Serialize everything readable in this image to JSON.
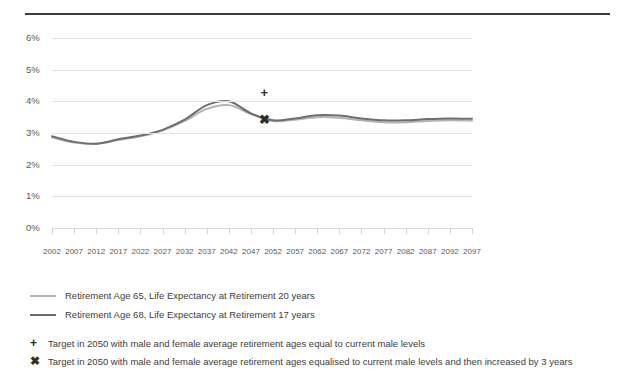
{
  "chart_data": {
    "type": "line",
    "title": "",
    "xlabel": "",
    "ylabel": "",
    "ylim": [
      0,
      6
    ],
    "xlim": [
      2002,
      2097
    ],
    "grid": true,
    "legend_position": "below-chart",
    "ytick_labels": [
      "0%",
      "1%",
      "2%",
      "3%",
      "4%",
      "5%",
      "6%"
    ],
    "ytick_values": [
      0,
      1,
      2,
      3,
      4,
      5,
      6
    ],
    "categories": [
      2002,
      2007,
      2012,
      2017,
      2022,
      2027,
      2032,
      2037,
      2042,
      2047,
      2052,
      2057,
      2062,
      2067,
      2072,
      2077,
      2082,
      2087,
      2092,
      2097
    ],
    "x": [
      2002,
      2007,
      2012,
      2017,
      2022,
      2027,
      2032,
      2037,
      2042,
      2047,
      2052,
      2057,
      2062,
      2067,
      2072,
      2077,
      2082,
      2087,
      2092,
      2097
    ],
    "series": [
      {
        "name": "Retirement Age 65, Life Expectancy at Retirement 20 years",
        "color": "#b3b3b3",
        "values": [
          2.86,
          2.7,
          2.66,
          2.78,
          2.9,
          3.08,
          3.38,
          3.76,
          3.88,
          3.6,
          3.38,
          3.42,
          3.5,
          3.48,
          3.4,
          3.34,
          3.34,
          3.38,
          3.4,
          3.39
        ]
      },
      {
        "name": "Retirement Age 68, Life Expectancy at Retirement 17 years",
        "color": "#6e6e6e",
        "values": [
          2.9,
          2.72,
          2.66,
          2.8,
          2.92,
          3.1,
          3.42,
          3.88,
          4.0,
          3.62,
          3.4,
          3.46,
          3.56,
          3.55,
          3.46,
          3.4,
          3.4,
          3.44,
          3.46,
          3.45
        ]
      }
    ],
    "markers": [
      {
        "symbol": "+",
        "x": 2050,
        "y": 4.3,
        "label": "Target in 2050 with male and female average retirement ages equal to current male levels"
      },
      {
        "symbol": "✖",
        "x": 2050,
        "y": 3.45,
        "label": "Target in 2050 with male and female average retirement ages equalised to current male levels and then increased by 3 years"
      }
    ]
  },
  "legend": {
    "items": [
      {
        "label": "Retirement Age 65, Life Expectancy at Retirement 20 years",
        "color": "#b3b3b3"
      },
      {
        "label": "Retirement Age 68, Life Expectancy at Retirement 17 years",
        "color": "#6e6e6e"
      }
    ]
  },
  "notes": [
    {
      "glyph": "+",
      "text": "Target in 2050 with male and female average retirement ages equal to current male levels"
    },
    {
      "glyph": "✖",
      "text": "Target in 2050 with male and female average retirement ages equalised to current male levels and then increased by 3 years"
    }
  ]
}
